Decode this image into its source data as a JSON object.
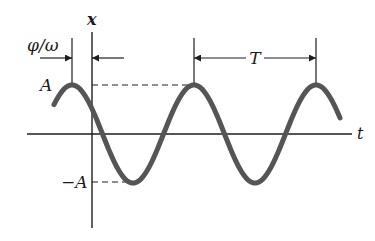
{
  "diagram": {
    "labels": {
      "x_axis": "x",
      "t_axis": "t",
      "amplitude": "A",
      "neg_amplitude": "−A",
      "phase_offset": "φ/ω",
      "period": "T"
    },
    "colors": {
      "curve": "#555555",
      "axes": "#1e1e1e",
      "background": "#ffffff"
    },
    "geometry": {
      "origin": [
        92,
        134
      ],
      "amplitude_px": 49,
      "period_px": 122,
      "first_peak_x": 72,
      "curve_x_range": [
        54,
        340
      ]
    }
  }
}
